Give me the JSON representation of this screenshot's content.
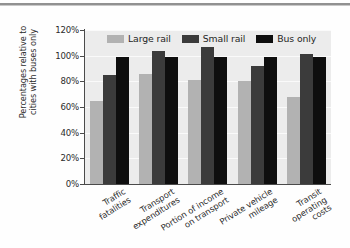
{
  "chart_data": {
    "type": "bar",
    "title": "",
    "subtitle": "",
    "xlabel": "",
    "ylabel": "Percentages relative to\ncities with buses only",
    "ylim": [
      0,
      120
    ],
    "ytick_labels": [
      "120%",
      "100%",
      "80%",
      "60%",
      "40%",
      "20%",
      "0%"
    ],
    "ytick_values": [
      120,
      100,
      80,
      60,
      40,
      20,
      0
    ],
    "grid": true,
    "grid_axis": "y",
    "legend_position": "top-inside",
    "categories": [
      "Traffic\nfatalities",
      "Transport\nexpenditures",
      "Portion of income\non transport",
      "Private vehicle\nmileage",
      "Transit\noperating\ncosts"
    ],
    "series": [
      {
        "name": "Large rail",
        "color": "#b2b2b2",
        "values": [
          65,
          86,
          81,
          80,
          68
        ]
      },
      {
        "name": "Small rail",
        "color": "#3b3b3b",
        "values": [
          85,
          104,
          107,
          92,
          101
        ]
      },
      {
        "name": "Bus only",
        "color": "#0e0e0e",
        "values": [
          99,
          99,
          99,
          99,
          99
        ]
      }
    ]
  },
  "colors": {
    "plot_background": "#ececec",
    "gridline": "#fbfbfb",
    "axis": "#4a4a4a",
    "text": "#2b2b2b",
    "page_background": "#fefefe"
  }
}
